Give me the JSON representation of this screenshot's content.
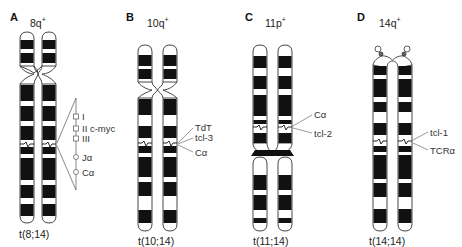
{
  "figure": {
    "panels": [
      {
        "letter": "A",
        "title": "8q",
        "title_sup": "+",
        "caption": "t(8;14)",
        "gene_labels": [
          "I",
          "II c-myc",
          "III",
          "Jα",
          "Cα"
        ]
      },
      {
        "letter": "B",
        "title": "10q",
        "title_sup": "+",
        "caption": "t(10;14)",
        "gene_labels": [
          "TdT",
          "tcl-3",
          "Cα"
        ]
      },
      {
        "letter": "C",
        "title": "11p",
        "title_sup": "+",
        "caption": "t(11;14)",
        "gene_labels": [
          "Cα",
          "tcl-2"
        ]
      },
      {
        "letter": "D",
        "title": "14q",
        "title_sup": "+",
        "caption": "t(14;14)",
        "gene_labels": [
          "tcl-1",
          "TCRα"
        ]
      }
    ],
    "colors": {
      "band_dark": "#111111",
      "band_light": "#ffffff",
      "outline": "#333333",
      "leader_line": "#555555"
    }
  }
}
